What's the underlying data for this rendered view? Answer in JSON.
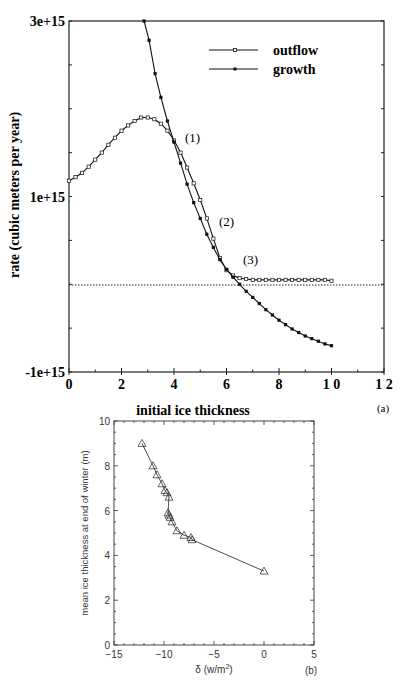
{
  "chart_data": [
    {
      "panel": "(a)",
      "type": "line",
      "title": "",
      "xlabel": "initial ice thickness",
      "ylabel": "rate   (cubic meters per year)",
      "xlim": [
        0,
        12
      ],
      "ylim": [
        -1000000000000000.0,
        3000000000000000.0
      ],
      "xticks": [
        0,
        2,
        4,
        6,
        8,
        10,
        12
      ],
      "xtick_labels": [
        "0",
        "2",
        "4",
        "6",
        "8",
        "1 0",
        "1 2"
      ],
      "yticks": [
        -1000000000000000.0,
        1000000000000000.0,
        3000000000000000.0
      ],
      "ytick_labels": [
        "-1e+15",
        "1e+15",
        "3e+15"
      ],
      "reference_line": {
        "y": 0,
        "style": "dotted"
      },
      "legend": {
        "position": "upper right",
        "entries": [
          "outflow",
          "growth"
        ]
      },
      "annotations": [
        {
          "text": "(1)",
          "x": 4.4,
          "y": 1620000000000000.0
        },
        {
          "text": "(2)",
          "x": 5.8,
          "y": 670000000000000.0
        },
        {
          "text": "(3)",
          "x": 6.6,
          "y": 120000000000000.0
        }
      ],
      "series": [
        {
          "name": "outflow",
          "marker": "open-square",
          "x": [
            0,
            0.25,
            0.5,
            0.75,
            1.0,
            1.25,
            1.5,
            1.75,
            2.0,
            2.25,
            2.5,
            2.75,
            3.0,
            3.25,
            3.5,
            3.75,
            4.0,
            4.25,
            4.5,
            4.75,
            5.0,
            5.25,
            5.5,
            5.75,
            6.0,
            6.25,
            6.5,
            6.75,
            7.0,
            7.25,
            7.5,
            7.75,
            8.0,
            8.25,
            8.5,
            8.75,
            9.0,
            9.25,
            9.5,
            9.75,
            10.0
          ],
          "values": [
            1180000000000000.0,
            1220000000000000.0,
            1270000000000000.0,
            1340000000000000.0,
            1420000000000000.0,
            1500000000000000.0,
            1590000000000000.0,
            1670000000000000.0,
            1750000000000000.0,
            1810000000000000.0,
            1860000000000000.0,
            1900000000000000.0,
            1900000000000000.0,
            1880000000000000.0,
            1830000000000000.0,
            1750000000000000.0,
            1640000000000000.0,
            1500000000000000.0,
            1330000000000000.0,
            1150000000000000.0,
            960000000000000.0,
            750000000000000.0,
            520000000000000.0,
            300000000000000.0,
            160000000000000.0,
            100000000000000.0,
            70000000000000.0,
            60000000000000.0,
            50000000000000.0,
            50000000000000.0,
            50000000000000.0,
            50000000000000.0,
            50000000000000.0,
            50000000000000.0,
            50000000000000.0,
            50000000000000.0,
            50000000000000.0,
            50000000000000.0,
            50000000000000.0,
            50000000000000.0,
            40000000000000.0
          ]
        },
        {
          "name": "growth",
          "marker": "filled-square",
          "x": [
            2.86,
            3.05,
            3.28,
            3.5,
            3.75,
            4.0,
            4.25,
            4.5,
            4.75,
            5.0,
            5.25,
            5.5,
            5.75,
            6.0,
            6.25,
            6.5,
            6.75,
            7.0,
            7.25,
            7.5,
            7.75,
            8.0,
            8.25,
            8.5,
            8.75,
            9.0,
            9.25,
            9.5,
            9.75,
            10.0
          ],
          "values": [
            3000000000000000.0,
            2780000000000000.0,
            2400000000000000.0,
            2130000000000000.0,
            1860000000000000.0,
            1620000000000000.0,
            1380000000000000.0,
            1140000000000000.0,
            930000000000000.0,
            750000000000000.0,
            570000000000000.0,
            420000000000000.0,
            280000000000000.0,
            170000000000000.0,
            80000000000000.0,
            0.0,
            -80000000000000.0,
            -150000000000000.0,
            -220000000000000.0,
            -290000000000000.0,
            -350000000000000.0,
            -410000000000000.0,
            -460000000000000.0,
            -510000000000000.0,
            -550000000000000.0,
            -590000000000000.0,
            -620000000000000.0,
            -650000000000000.0,
            -680000000000000.0,
            -700000000000000.0
          ]
        }
      ]
    },
    {
      "panel": "(b)",
      "type": "line",
      "title": "",
      "xlabel": "δ (w/m²)",
      "ylabel": "mean ice thickness at end of winter  (m)",
      "xlim": [
        -15,
        5
      ],
      "ylim": [
        0,
        10
      ],
      "xticks": [
        -15,
        -10,
        -5,
        0,
        5
      ],
      "xtick_labels": [
        "−15",
        "−10",
        "−5",
        "0",
        "5"
      ],
      "yticks": [
        0,
        2,
        4,
        6,
        8,
        10
      ],
      "ytick_labels": [
        "0",
        "2",
        "4",
        "6",
        "8",
        "10"
      ],
      "series": [
        {
          "name": "mean ice thickness",
          "marker": "open-triangle",
          "x": [
            -12.2,
            -11.1,
            -10.7,
            -10.2,
            -9.9,
            -9.7,
            -9.5,
            -9.6,
            -9.5,
            -9.4,
            -9.2,
            -8.7,
            -8.0,
            -7.3,
            -7.2,
            0.0
          ],
          "values": [
            9.0,
            8.0,
            7.6,
            7.2,
            6.9,
            6.8,
            6.6,
            5.9,
            5.8,
            5.7,
            5.5,
            5.1,
            4.9,
            4.8,
            4.7,
            3.3
          ]
        }
      ]
    }
  ],
  "labels": {
    "panel_a": "(a)",
    "panel_b": "(b)",
    "top_xlabel": "initial ice thickness",
    "top_ylabel": "rate   (cubic meters per year)",
    "bottom_xlabel_prefix": "δ (w/m",
    "bottom_xlabel_sup": "2",
    "bottom_xlabel_suffix": ")",
    "bottom_ylabel": "mean ice thickness at end of winter  (m)",
    "legend_outflow": "outflow",
    "legend_growth": "growth",
    "ann1": "(1)",
    "ann2": "(2)",
    "ann3": "(3)"
  },
  "colors": {
    "line": "#111111",
    "axis": "#222222",
    "background": "#ffffff"
  }
}
